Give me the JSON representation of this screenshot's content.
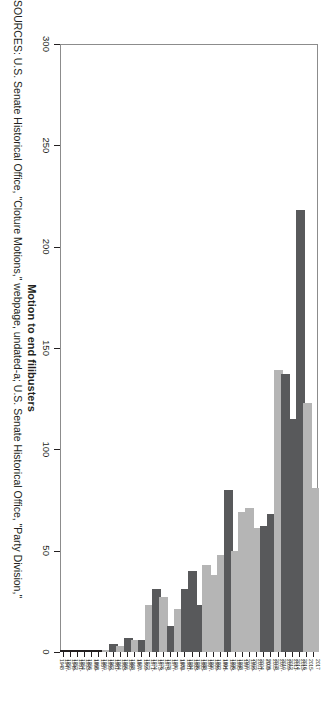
{
  "figure": {
    "source_note": "SOURCES: U.S. Senate Historical Office, \"Cloture Motions,\" webpage, undated-a; U.S. Senate Historical Office, \"Party Division,\"",
    "colors": {
      "light_bar": "#b5b5b5",
      "dark_bar": "#58595b",
      "axis": "#231f20",
      "plot_border": "#8c8c8c",
      "background": "#ffffff"
    }
  },
  "chart_data": {
    "type": "bar",
    "orientation": "horizontal",
    "title": "",
    "xlabel": "",
    "ylabel": "Motion to end filibusters",
    "ylim": [
      0,
      300
    ],
    "yticks": [
      0,
      50,
      100,
      150,
      200,
      250,
      300
    ],
    "ytick_labels": [
      "0",
      "50",
      "100",
      "150",
      "200",
      "250",
      "300"
    ],
    "grid": false,
    "legend": "none",
    "categories": [
      "1947-1948",
      "1949-1950",
      "1951-1952",
      "1953-1954",
      "1955-1956",
      "1957-1958",
      "1959-1960",
      "1961-1962",
      "1963-1964",
      "1965-1966",
      "1967-1968",
      "1969-1970",
      "1971-1972",
      "1973-1974",
      "1975-1976",
      "1977-1978",
      "1979-1980",
      "1981-1982",
      "1983-1984",
      "1985-1986",
      "1987-1988",
      "1989-1990",
      "1991-1992",
      "1993-1994",
      "1995-1996",
      "1997-1998",
      "1999-2000",
      "2001-2002",
      "2003-2004",
      "2005-2006",
      "2007-2008",
      "2009-2010",
      "2011-2012",
      "2013-2014",
      "2015-2016",
      "2017"
    ],
    "category_label_rows": [
      [
        "1947-",
        "1948"
      ],
      [
        "1949-",
        "1950"
      ],
      [
        "1951-",
        "1952"
      ],
      [
        "1953-",
        "1954"
      ],
      [
        "1955-",
        "1956"
      ],
      [
        "1957-",
        "1958"
      ],
      [
        "1959-",
        "1960"
      ],
      [
        "1961-",
        "1962"
      ],
      [
        "1963-",
        "1964"
      ],
      [
        "1965-",
        "1966"
      ],
      [
        "1967-",
        "1968"
      ],
      [
        "1969-",
        "1970"
      ],
      [
        "1971-",
        "1972"
      ],
      [
        "1973-",
        "1974"
      ],
      [
        "1975-",
        "1976"
      ],
      [
        "1977-",
        "1978"
      ],
      [
        "1979-",
        "1980"
      ],
      [
        "1981-",
        "1982"
      ],
      [
        "1983-",
        "1984"
      ],
      [
        "1985-",
        "1986"
      ],
      [
        "1987-",
        "1988"
      ],
      [
        "1989-",
        "1990"
      ],
      [
        "1991-",
        "1992"
      ],
      [
        "1993-",
        "1994"
      ],
      [
        "1995-",
        "1996"
      ],
      [
        "1997-",
        "1998"
      ],
      [
        "1999-",
        "2000"
      ],
      [
        "2001-",
        "2002"
      ],
      [
        "2003-",
        "2004"
      ],
      [
        "2005-",
        "2006"
      ],
      [
        "2007-",
        "2008"
      ],
      [
        "2009-",
        "2010"
      ],
      [
        "2011-",
        "2012"
      ],
      [
        "2013-",
        "2014"
      ],
      [
        "2015-",
        "2016"
      ],
      [
        "2017",
        ""
      ]
    ],
    "values": [
      0,
      0,
      0,
      0,
      0,
      0,
      1,
      4,
      3,
      7,
      6,
      6,
      23,
      31,
      27,
      13,
      21,
      31,
      40,
      23,
      43,
      38,
      48,
      80,
      50,
      69,
      71,
      61,
      62,
      68,
      139,
      137,
      115,
      218,
      123,
      81
    ],
    "bar_shades": [
      "light",
      "dark",
      "light",
      "dark",
      "light",
      "dark",
      "light",
      "dark",
      "light",
      "dark",
      "light",
      "dark",
      "light",
      "dark",
      "light",
      "dark",
      "light",
      "dark",
      "dark",
      "dark",
      "light",
      "light",
      "light",
      "dark",
      "light",
      "light",
      "light",
      "light",
      "dark",
      "dark",
      "light",
      "dark",
      "dark",
      "dark",
      "light",
      "light"
    ]
  }
}
